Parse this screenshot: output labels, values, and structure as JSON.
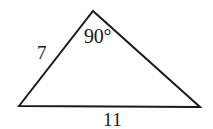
{
  "figure": {
    "kind": "geometry-triangle-diagram",
    "canvas": {
      "width": 213,
      "height": 129,
      "background": "#fefefe"
    },
    "stroke": {
      "color": "#1a1a1a",
      "width": 2
    },
    "vertices": {
      "left": {
        "x": 19,
        "y": 106
      },
      "apex": {
        "x": 93,
        "y": 11
      },
      "right": {
        "x": 200,
        "y": 107
      }
    },
    "labels": {
      "angle_at_apex": "90°",
      "side_left": "7",
      "side_base": "11"
    }
  },
  "chart_data": {
    "type": "diagram",
    "title": "",
    "subtitle": "",
    "shape": "triangle",
    "points": [
      {
        "name": "left-vertex",
        "x": 19,
        "y": 106
      },
      {
        "name": "apex-vertex",
        "x": 93,
        "y": 11
      },
      {
        "name": "right-vertex",
        "x": 200,
        "y": 107
      }
    ],
    "edges": [
      {
        "from": "left-vertex",
        "to": "apex-vertex",
        "label": "7"
      },
      {
        "from": "apex-vertex",
        "to": "right-vertex",
        "label": ""
      },
      {
        "from": "left-vertex",
        "to": "right-vertex",
        "label": "11"
      }
    ],
    "annotations": [
      {
        "text": "90°",
        "at": "apex-vertex",
        "kind": "angle-measure"
      },
      {
        "text": "7",
        "at": "left-edge",
        "kind": "side-length"
      },
      {
        "text": "11",
        "at": "base-edge",
        "kind": "side-length"
      }
    ],
    "grid": false,
    "legend": null,
    "xlabel": "",
    "ylabel": ""
  }
}
